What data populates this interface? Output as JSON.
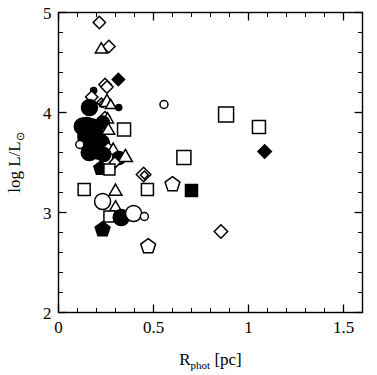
{
  "chart_data": {
    "type": "scatter",
    "title": "",
    "xlabel": "R_phot [pc]",
    "xlabel_main": "R",
    "xlabel_subscript": "phot",
    "xlabel_unit": "[pc]",
    "ylabel": "log L/L_sun",
    "ylabel_main": "log L/L",
    "ylabel_subscript": "⊙",
    "xlim": [
      0,
      1.6
    ],
    "ylim": [
      2,
      5
    ],
    "xticks": [
      0,
      0.5,
      1,
      1.5
    ],
    "xticklabels": [
      "0",
      "0.5",
      "1",
      "1.5"
    ],
    "yticks": [
      2,
      3,
      4,
      5
    ],
    "yticklabels": [
      "2",
      "3",
      "4",
      "5"
    ],
    "x_minor_step": 0.1,
    "y_minor_step": 0.2,
    "grid": false,
    "legend": null,
    "axis_color": "#000000",
    "background": "#ffffff",
    "marker_styles": {
      "open_diamond": "open diamond",
      "filled_diamond": "filled diamond",
      "open_square": "open square",
      "filled_square": "filled square",
      "open_circle": "open circle",
      "filled_circle": "filled circle",
      "open_triangle": "open triangle",
      "open_pentagon": "open pentagon",
      "filled_pentagon": "filled pentagon"
    },
    "points": [
      {
        "x": 0.215,
        "y": 4.9,
        "marker": "open_diamond",
        "size": 11
      },
      {
        "x": 0.265,
        "y": 4.66,
        "marker": "open_diamond",
        "size": 11
      },
      {
        "x": 0.225,
        "y": 4.63,
        "marker": "open_triangle",
        "size": 11
      },
      {
        "x": 0.315,
        "y": 4.33,
        "marker": "filled_diamond",
        "size": 11
      },
      {
        "x": 0.245,
        "y": 4.28,
        "marker": "open_diamond",
        "size": 11
      },
      {
        "x": 0.255,
        "y": 4.255,
        "marker": "open_diamond",
        "size": 11
      },
      {
        "x": 0.185,
        "y": 4.22,
        "marker": "filled_circle",
        "size": 6
      },
      {
        "x": 0.175,
        "y": 4.155,
        "marker": "open_diamond",
        "size": 11
      },
      {
        "x": 0.225,
        "y": 4.1,
        "marker": "open_diamond",
        "size": 8
      },
      {
        "x": 0.235,
        "y": 4.09,
        "marker": "open_diamond",
        "size": 7
      },
      {
        "x": 0.255,
        "y": 4.1,
        "marker": "open_triangle",
        "size": 13
      },
      {
        "x": 0.275,
        "y": 4.07,
        "marker": "open_triangle",
        "size": 10
      },
      {
        "x": 0.163,
        "y": 4.05,
        "marker": "filled_circle",
        "size": 16
      },
      {
        "x": 0.317,
        "y": 4.05,
        "marker": "filled_circle",
        "size": 6
      },
      {
        "x": 0.245,
        "y": 3.96,
        "marker": "open_diamond",
        "size": 9
      },
      {
        "x": 0.258,
        "y": 3.93,
        "marker": "open_triangle",
        "size": 11
      },
      {
        "x": 0.233,
        "y": 3.9,
        "marker": "filled_circle",
        "size": 13
      },
      {
        "x": 0.128,
        "y": 3.86,
        "marker": "filled_circle",
        "size": 17
      },
      {
        "x": 0.148,
        "y": 3.85,
        "marker": "filled_circle",
        "size": 20
      },
      {
        "x": 0.175,
        "y": 3.83,
        "marker": "filled_circle",
        "size": 21
      },
      {
        "x": 0.345,
        "y": 3.83,
        "marker": "open_square",
        "size": 13
      },
      {
        "x": 0.262,
        "y": 3.82,
        "marker": "open_triangle",
        "size": 12
      },
      {
        "x": 0.155,
        "y": 3.76,
        "marker": "filled_circle",
        "size": 20
      },
      {
        "x": 0.192,
        "y": 3.73,
        "marker": "filled_circle",
        "size": 18
      },
      {
        "x": 0.228,
        "y": 3.7,
        "marker": "filled_circle",
        "size": 15
      },
      {
        "x": 0.112,
        "y": 3.68,
        "marker": "open_circle",
        "size": 8
      },
      {
        "x": 0.205,
        "y": 3.62,
        "marker": "filled_circle",
        "size": 17
      },
      {
        "x": 0.162,
        "y": 3.6,
        "marker": "filled_circle",
        "size": 16
      },
      {
        "x": 0.262,
        "y": 3.65,
        "marker": "open_diamond",
        "size": 9
      },
      {
        "x": 0.288,
        "y": 3.62,
        "marker": "open_triangle",
        "size": 12
      },
      {
        "x": 0.238,
        "y": 3.58,
        "marker": "filled_circle",
        "size": 14
      },
      {
        "x": 0.318,
        "y": 3.545,
        "marker": "filled_circle",
        "size": 13
      },
      {
        "x": 0.352,
        "y": 3.55,
        "marker": "open_triangle",
        "size": 13
      },
      {
        "x": 0.297,
        "y": 3.5,
        "marker": "open_diamond",
        "size": 10
      },
      {
        "x": 0.222,
        "y": 3.44,
        "marker": "filled_pentagon",
        "size": 12
      },
      {
        "x": 0.268,
        "y": 3.43,
        "marker": "open_square",
        "size": 11
      },
      {
        "x": 0.135,
        "y": 3.23,
        "marker": "open_square",
        "size": 12
      },
      {
        "x": 0.3,
        "y": 3.21,
        "marker": "open_triangle",
        "size": 12
      },
      {
        "x": 0.232,
        "y": 3.11,
        "marker": "open_circle",
        "size": 16
      },
      {
        "x": 0.3,
        "y": 3.05,
        "marker": "open_triangle",
        "size": 11
      },
      {
        "x": 0.268,
        "y": 2.96,
        "marker": "open_square",
        "size": 11
      },
      {
        "x": 0.33,
        "y": 2.95,
        "marker": "filled_circle",
        "size": 16
      },
      {
        "x": 0.232,
        "y": 2.83,
        "marker": "filled_pentagon",
        "size": 13
      },
      {
        "x": 0.395,
        "y": 2.99,
        "marker": "open_circle",
        "size": 16
      },
      {
        "x": 0.452,
        "y": 2.96,
        "marker": "open_circle",
        "size": 8
      },
      {
        "x": 0.448,
        "y": 3.38,
        "marker": "open_diamond",
        "size": 13
      },
      {
        "x": 0.452,
        "y": 3.375,
        "marker": "open_diamond",
        "size": 7
      },
      {
        "x": 0.468,
        "y": 3.23,
        "marker": "open_square",
        "size": 12
      },
      {
        "x": 0.472,
        "y": 2.66,
        "marker": "open_pentagon",
        "size": 13
      },
      {
        "x": 0.555,
        "y": 4.08,
        "marker": "open_circle",
        "size": 8
      },
      {
        "x": 0.6,
        "y": 3.28,
        "marker": "open_pentagon",
        "size": 13
      },
      {
        "x": 0.66,
        "y": 3.55,
        "marker": "open_square",
        "size": 14
      },
      {
        "x": 0.7,
        "y": 3.22,
        "marker": "filled_square",
        "size": 12
      },
      {
        "x": 0.882,
        "y": 3.98,
        "marker": "open_square",
        "size": 15
      },
      {
        "x": 0.855,
        "y": 2.81,
        "marker": "open_diamond",
        "size": 12
      },
      {
        "x": 1.055,
        "y": 3.855,
        "marker": "open_square",
        "size": 13
      },
      {
        "x": 1.085,
        "y": 3.61,
        "marker": "filled_diamond",
        "size": 12
      }
    ]
  },
  "axes": {
    "x_axis_name": "R_phot [pc] axis",
    "y_axis_name": "log L/L_sun axis"
  }
}
